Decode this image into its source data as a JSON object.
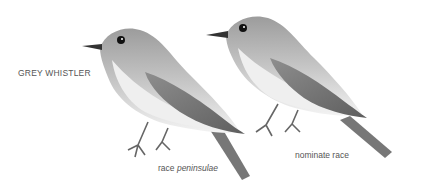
{
  "title": "GREY WHISTLER",
  "figures": [
    {
      "id": "bird-left",
      "caption_prefix": "race ",
      "caption_italic": "peninsulae"
    },
    {
      "id": "bird-right",
      "caption": "nominate race"
    }
  ],
  "colors": {
    "text": "#555555",
    "head": "#9a9a9a",
    "back": "#8a8a8a",
    "wing": "#6f6f6f",
    "throat": "#e6e6e6",
    "belly": "#f2f2f2"
  }
}
